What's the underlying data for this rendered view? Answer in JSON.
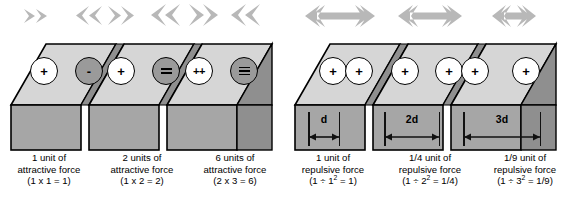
{
  "figure": {
    "left_panel": {
      "kind": "attractive-force-series",
      "top_arrows": [
        {
          "name": "arrow-right-single",
          "direction": "right",
          "size": "small"
        },
        {
          "name": "arrow-left-pair-1",
          "direction": "left",
          "size": "medium"
        },
        {
          "name": "arrow-right-pair-1",
          "direction": "right",
          "size": "medium"
        },
        {
          "name": "arrow-left-pair-2",
          "direction": "left",
          "size": "large"
        },
        {
          "name": "arrow-right-pair-2",
          "direction": "right",
          "size": "large"
        },
        {
          "name": "arrow-left-pair-3",
          "direction": "left",
          "size": "large"
        }
      ],
      "charges": [
        {
          "label": "+",
          "sign": "positive",
          "magnitude": 1
        },
        {
          "label": "-",
          "sign": "negative",
          "magnitude": 1
        },
        {
          "label": "+",
          "sign": "positive",
          "magnitude": 1
        },
        {
          "label": "=",
          "sign": "negative",
          "magnitude": 2
        },
        {
          "label": "++",
          "sign": "positive",
          "magnitude": 2
        },
        {
          "label": "≡",
          "sign": "negative",
          "magnitude": 3
        }
      ],
      "captions": [
        {
          "line1": "1 unit of",
          "line2": "attractive force",
          "formula": "(1 x 1 = 1)"
        },
        {
          "line1": "2 units of",
          "line2": "attractive force",
          "formula": "(1 x 2 = 2)"
        },
        {
          "line1": "6 units of",
          "line2": "attractive force",
          "formula": "(2 x 3 = 6)"
        }
      ]
    },
    "right_panel": {
      "kind": "repulsive-force-series",
      "top_arrows": [
        {
          "name": "double-arrow-long",
          "direction": "both",
          "size": "large"
        },
        {
          "name": "double-arrow-medium",
          "direction": "both",
          "size": "medium"
        },
        {
          "name": "double-arrow-short",
          "direction": "both",
          "size": "small"
        }
      ],
      "charges": [
        {
          "label": "+",
          "sign": "positive",
          "magnitude": 1
        },
        {
          "label": "+",
          "sign": "positive",
          "magnitude": 1
        },
        {
          "label": "+",
          "sign": "positive",
          "magnitude": 1
        },
        {
          "label": "+",
          "sign": "positive",
          "magnitude": 1
        },
        {
          "label": "+",
          "sign": "positive",
          "magnitude": 1
        },
        {
          "label": "+",
          "sign": "positive",
          "magnitude": 1
        }
      ],
      "distances": [
        {
          "label": "d"
        },
        {
          "label": "2d"
        },
        {
          "label": "3d"
        }
      ],
      "captions": [
        {
          "line1": "1 unit of",
          "line2": "repulsive force",
          "formula_pre": "(1 ÷ 1",
          "formula_exp": "2",
          "formula_post": " = 1)"
        },
        {
          "line1": "1/4 unit of",
          "line2": "repulsive force",
          "formula_pre": "(1 ÷ 2",
          "formula_exp": "2",
          "formula_post": " = 1/4)"
        },
        {
          "line1": "1/9 unit of",
          "line2": "repulsive force",
          "formula_pre": "(1 ÷ 3",
          "formula_exp": "2",
          "formula_post": " = 1/9)"
        }
      ]
    },
    "colors": {
      "arrow_gray": "#b8b8b8",
      "block_top": "#d6d6d6",
      "block_front": "#a6a6a6",
      "block_side": "#8f8f8f",
      "outline": "#000000",
      "charge_positive_fill": "#ffffff",
      "charge_negative_fill": "#9a9a9a"
    }
  }
}
